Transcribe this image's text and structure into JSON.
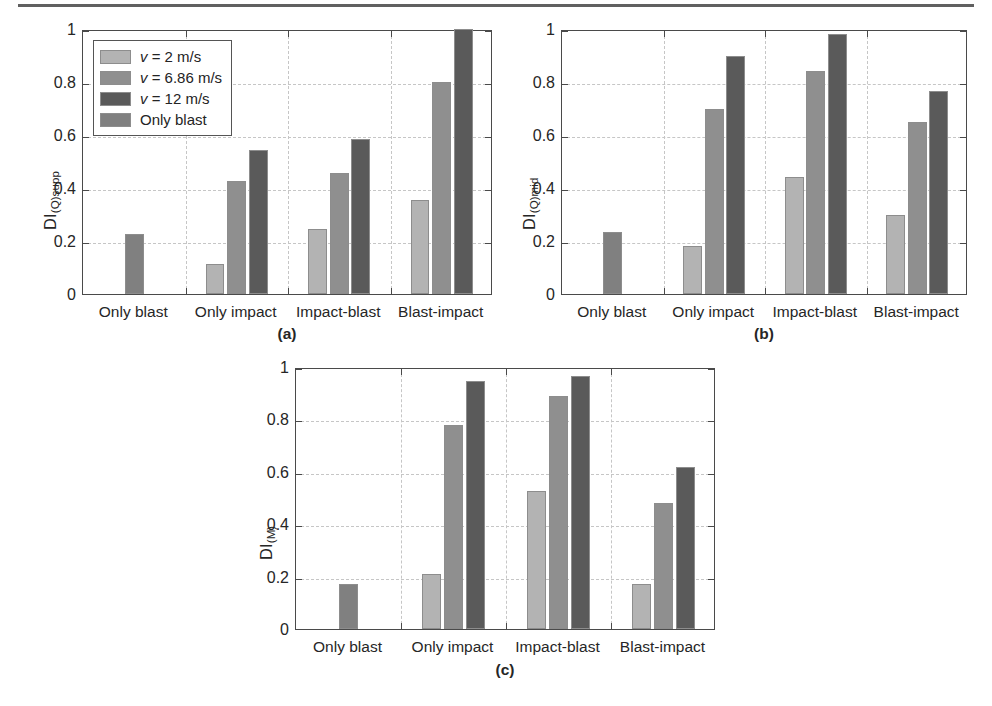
{
  "figure": {
    "background": "#ffffff",
    "axis_color": "#4a4a4a",
    "grid_color": "#c6c6c6"
  },
  "legend": {
    "entries": [
      {
        "label_italic": "v",
        "label_rest": " = 2 m/s",
        "color": "#b3b3b3"
      },
      {
        "label_italic": "v",
        "label_rest": " = 6.86 m/s",
        "color": "#8f8f8f"
      },
      {
        "label_italic": "v",
        "label_rest": " = 12 m/s",
        "color": "#5a5a5a"
      },
      {
        "label_italic": "",
        "label_rest": "Only blast",
        "color": "#808080"
      }
    ]
  },
  "series_colors": {
    "v2": "#b3b3b3",
    "v686": "#8f8f8f",
    "v12": "#5a5a5a",
    "only_blast": "#808080"
  },
  "yticks": [
    "0",
    "0.2",
    "0.4",
    "0.6",
    "0.8",
    "1"
  ],
  "ytick_values": [
    0,
    0.2,
    0.4,
    0.6,
    0.8,
    1
  ],
  "categories": [
    "Only blast",
    "Only impact",
    "Impact-blast",
    "Blast-impact"
  ],
  "chart_data": [
    {
      "type": "bar",
      "panel": "a",
      "caption": "(a)",
      "title": "",
      "xlabel": "",
      "ylabel": "DI(Q)supp",
      "ylabel_main": "DI",
      "ylabel_sub": "(Q)supp",
      "ylim": [
        0,
        1
      ],
      "grid": true,
      "legend_position": "upper-left",
      "categories": [
        "Only blast",
        "Only impact",
        "Impact-blast",
        "Blast-impact"
      ],
      "series": [
        {
          "name": "v = 2 m/s",
          "color": "#b3b3b3",
          "values": [
            null,
            0.115,
            0.245,
            0.355
          ]
        },
        {
          "name": "v = 6.86 m/s",
          "color": "#8f8f8f",
          "values": [
            null,
            0.425,
            0.455,
            0.8
          ]
        },
        {
          "name": "v = 12 m/s",
          "color": "#5a5a5a",
          "values": [
            null,
            0.545,
            0.585,
            1.0
          ]
        },
        {
          "name": "Only blast",
          "color": "#808080",
          "values": [
            0.225,
            null,
            null,
            null
          ]
        }
      ]
    },
    {
      "type": "bar",
      "panel": "b",
      "caption": "(b)",
      "title": "",
      "xlabel": "",
      "ylabel": "DI(Q)mid",
      "ylabel_main": "DI",
      "ylabel_sub": "(Q)mid",
      "ylim": [
        0,
        1
      ],
      "grid": true,
      "legend_position": "none",
      "categories": [
        "Only blast",
        "Only impact",
        "Impact-blast",
        "Blast-impact"
      ],
      "series": [
        {
          "name": "v = 2 m/s",
          "color": "#b3b3b3",
          "values": [
            null,
            0.18,
            0.44,
            0.3
          ]
        },
        {
          "name": "v = 6.86 m/s",
          "color": "#8f8f8f",
          "values": [
            null,
            0.7,
            0.84,
            0.65
          ]
        },
        {
          "name": "v = 12 m/s",
          "color": "#5a5a5a",
          "values": [
            null,
            0.9,
            0.98,
            0.765
          ]
        },
        {
          "name": "Only blast",
          "color": "#808080",
          "values": [
            0.235,
            null,
            null,
            null
          ]
        }
      ]
    },
    {
      "type": "bar",
      "panel": "c",
      "caption": "(c)",
      "title": "",
      "xlabel": "",
      "ylabel": "DI(M)",
      "ylabel_main": "DI",
      "ylabel_sub": "(M)",
      "ylim": [
        0,
        1
      ],
      "grid": true,
      "legend_position": "none",
      "categories": [
        "Only blast",
        "Only impact",
        "Impact-blast",
        "Blast-impact"
      ],
      "series": [
        {
          "name": "v = 2 m/s",
          "color": "#b3b3b3",
          "values": [
            null,
            0.21,
            0.525,
            0.17
          ]
        },
        {
          "name": "v = 6.86 m/s",
          "color": "#8f8f8f",
          "values": [
            null,
            0.78,
            0.89,
            0.48
          ]
        },
        {
          "name": "v = 12 m/s",
          "color": "#5a5a5a",
          "values": [
            null,
            0.945,
            0.965,
            0.62
          ]
        },
        {
          "name": "Only blast",
          "color": "#808080",
          "values": [
            0.17,
            null,
            null,
            null
          ]
        }
      ]
    }
  ]
}
